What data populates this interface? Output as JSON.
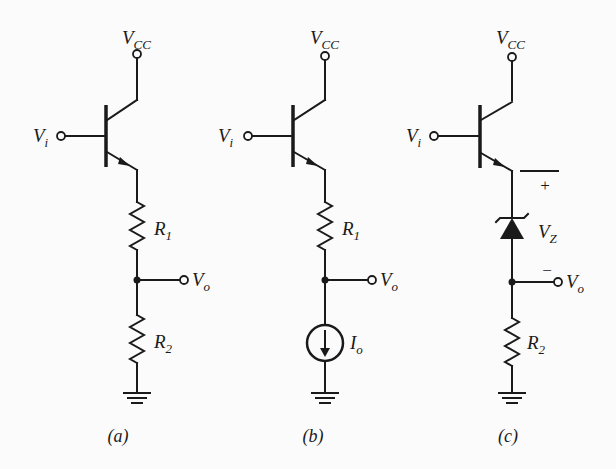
{
  "figure": {
    "panels": [
      {
        "caption": "(a)",
        "supply": {
          "main": "V",
          "sub": "CC"
        },
        "input": {
          "main": "V",
          "sub": "i"
        },
        "output": {
          "main": "V",
          "sub": "o"
        },
        "upper_element": {
          "main": "R",
          "sub": "1"
        },
        "lower_element": {
          "main": "R",
          "sub": "2"
        }
      },
      {
        "caption": "(b)",
        "supply": {
          "main": "V",
          "sub": "CC"
        },
        "input": {
          "main": "V",
          "sub": "i"
        },
        "output": {
          "main": "V",
          "sub": "o"
        },
        "upper_element": {
          "main": "R",
          "sub": "1"
        },
        "lower_element": {
          "main": "I",
          "sub": "o"
        }
      },
      {
        "caption": "(c)",
        "supply": {
          "main": "V",
          "sub": "CC"
        },
        "input": {
          "main": "V",
          "sub": "i"
        },
        "output": {
          "main": "V",
          "sub": "o"
        },
        "upper_element": {
          "main": "V",
          "sub": "Z"
        },
        "lower_element": {
          "main": "R",
          "sub": "2"
        },
        "plus_sign": "+",
        "minus_sign": "−"
      }
    ]
  }
}
